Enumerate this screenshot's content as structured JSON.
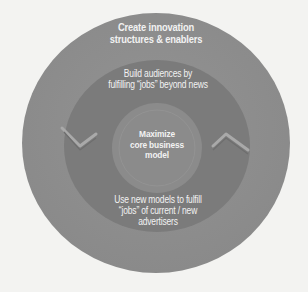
{
  "diagram": {
    "type": "concentric-circles",
    "colors": {
      "background": "#f3f3f1",
      "outer_ring": "#8f8f8f",
      "middle_ring": "#7b7b7b",
      "core_circle": "#8b8b8b",
      "arrow_highlight": "#a9a9a9",
      "text": "#f2f2f2"
    },
    "outer_ring": {
      "label_lines": [
        "Create innovation",
        "structures & enablers"
      ]
    },
    "middle_ring": {
      "top_label_lines": [
        "Build audiences by",
        "fulfilling “jobs” beyond news"
      ],
      "bottom_label_lines": [
        "Use new models to fulfill",
        "“jobs” of current / new",
        "advertisers"
      ]
    },
    "core": {
      "label_lines": [
        "Maximize",
        "core business",
        "model"
      ]
    }
  }
}
